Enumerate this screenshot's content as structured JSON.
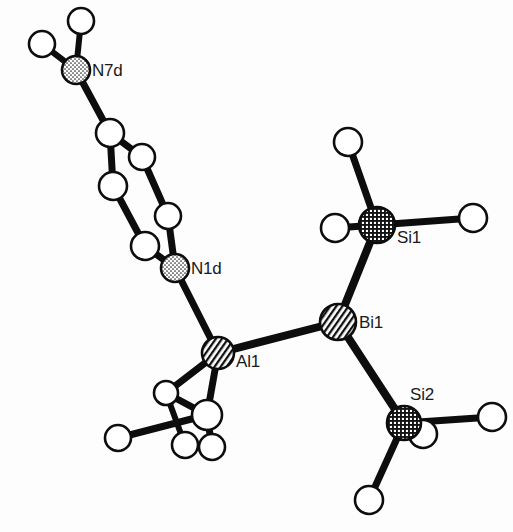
{
  "figure": {
    "name": "ortep-crystal-structure",
    "caption": "",
    "background_color": "#fdfdfd",
    "line_color": "#0d0d0d"
  },
  "labels": {
    "n7d": "N7d",
    "n1d": "N1d",
    "al1": "Al1",
    "bi1": "Bi1",
    "si1": "Si1",
    "si2": "Si2"
  },
  "atoms": {
    "heavy": [
      {
        "id": "N7d",
        "element": "N",
        "label": "N7d",
        "cx": 76,
        "cy": 70,
        "r": 14,
        "fill": "stipple",
        "label_dx": 16,
        "label_dy": 6
      },
      {
        "id": "N1d",
        "element": "N",
        "label": "N1d",
        "cx": 175,
        "cy": 268,
        "r": 14,
        "fill": "stipple",
        "label_dx": 16,
        "label_dy": 6
      },
      {
        "id": "Al1",
        "element": "Al",
        "label": "Al1",
        "cx": 218,
        "cy": 353,
        "r": 16,
        "fill": "diagonal",
        "label_dx": 18,
        "label_dy": 14
      },
      {
        "id": "Bi1",
        "element": "Bi",
        "label": "Bi1",
        "cx": 338,
        "cy": 322,
        "r": 18,
        "fill": "diagonal",
        "label_dx": 21,
        "label_dy": 6
      },
      {
        "id": "Si1",
        "element": "Si",
        "label": "Si1",
        "cx": 377,
        "cy": 225,
        "r": 18,
        "fill": "crosshatch",
        "label_dx": 20,
        "label_dy": 18
      },
      {
        "id": "Si2",
        "element": "Si",
        "label": "Si2",
        "cx": 404,
        "cy": 423,
        "r": 17,
        "fill": "crosshatch",
        "label_dx": 6,
        "label_dy": -23
      }
    ],
    "carbons": [
      {
        "id": "C1",
        "cx": 110,
        "cy": 133,
        "r": 14
      },
      {
        "id": "C2",
        "cx": 142,
        "cy": 157,
        "r": 13
      },
      {
        "id": "C3",
        "cx": 113,
        "cy": 186,
        "r": 14
      },
      {
        "id": "C4",
        "cx": 168,
        "cy": 216,
        "r": 13
      },
      {
        "id": "C5",
        "cx": 145,
        "cy": 246,
        "r": 14
      },
      {
        "id": "CM1",
        "cx": 166,
        "cy": 393,
        "r": 12
      },
      {
        "id": "CM2",
        "cx": 207,
        "cy": 415,
        "r": 15
      }
    ],
    "hydrogens": [
      {
        "id": "H7a",
        "cx": 42,
        "cy": 44,
        "r": 13
      },
      {
        "id": "H7b",
        "cx": 81,
        "cy": 21,
        "r": 13
      },
      {
        "id": "HM1",
        "cx": 118,
        "cy": 438,
        "r": 13
      },
      {
        "id": "HM2",
        "cx": 185,
        "cy": 445,
        "r": 13
      },
      {
        "id": "HM3",
        "cx": 212,
        "cy": 447,
        "r": 13
      },
      {
        "id": "HS1a",
        "cx": 348,
        "cy": 142,
        "r": 14
      },
      {
        "id": "HS1b",
        "cx": 335,
        "cy": 228,
        "r": 14
      },
      {
        "id": "HS1c",
        "cx": 473,
        "cy": 218,
        "r": 14
      },
      {
        "id": "HS2a",
        "cx": 423,
        "cy": 434,
        "r": 14
      },
      {
        "id": "HS2b",
        "cx": 492,
        "cy": 417,
        "r": 14
      },
      {
        "id": "HS2c",
        "cx": 369,
        "cy": 500,
        "r": 14
      }
    ]
  },
  "bonds": [
    {
      "from": "H7a",
      "to": "N7d",
      "width": 6
    },
    {
      "from": "H7b",
      "to": "N7d",
      "width": 6
    },
    {
      "from": "N7d",
      "to": "C1",
      "width": 7
    },
    {
      "from": "C1",
      "to": "C2",
      "width": 7
    },
    {
      "from": "C1",
      "to": "C3",
      "width": 7
    },
    {
      "from": "C2",
      "to": "C4",
      "width": 7
    },
    {
      "from": "C3",
      "to": "C5",
      "width": 7
    },
    {
      "from": "C4",
      "to": "N1d",
      "width": 7
    },
    {
      "from": "C5",
      "to": "N1d",
      "width": 7
    },
    {
      "from": "N1d",
      "to": "Al1",
      "width": 7
    },
    {
      "from": "Al1",
      "to": "Bi1",
      "width": 8
    },
    {
      "from": "Al1",
      "to": "CM1",
      "width": 7
    },
    {
      "from": "Al1",
      "to": "CM2",
      "width": 7
    },
    {
      "from": "CM1",
      "to": "CM2",
      "width": 7
    },
    {
      "from": "CM2",
      "to": "HM1",
      "width": 7
    },
    {
      "from": "CM2",
      "to": "HM3",
      "width": 7
    },
    {
      "from": "CM1",
      "to": "HM2",
      "width": 6
    },
    {
      "from": "Bi1",
      "to": "Si1",
      "width": 8
    },
    {
      "from": "Bi1",
      "to": "Si2",
      "width": 8
    },
    {
      "from": "Si1",
      "to": "HS1a",
      "width": 7
    },
    {
      "from": "Si1",
      "to": "HS1b",
      "width": 7
    },
    {
      "from": "Si1",
      "to": "HS1c",
      "width": 7
    },
    {
      "from": "Si2",
      "to": "HS2a",
      "width": 7
    },
    {
      "from": "Si2",
      "to": "HS2b",
      "width": 7
    },
    {
      "from": "Si2",
      "to": "HS2c",
      "width": 7
    }
  ]
}
